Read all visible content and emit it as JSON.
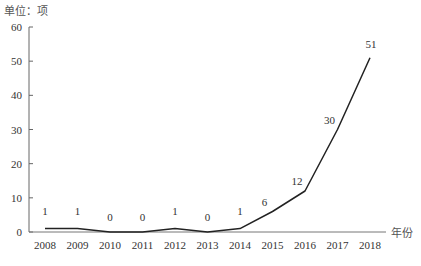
{
  "chart_data": {
    "type": "line",
    "title": "",
    "ylabel": "单位：项",
    "xlabel": "年份",
    "categories": [
      "2008",
      "2009",
      "2010",
      "2011",
      "2012",
      "2013",
      "2014",
      "2015",
      "2016",
      "2017",
      "2018"
    ],
    "series": [
      {
        "name": "",
        "values": [
          1,
          1,
          0,
          0,
          1,
          0,
          1,
          6,
          12,
          30,
          51
        ]
      }
    ],
    "data_labels": [
      "1",
      "1",
      "0",
      "0",
      "1",
      "0",
      "1",
      "6",
      "12",
      "30",
      "51"
    ],
    "ylim": [
      0,
      60
    ],
    "yticks": [
      "0",
      "10",
      "20",
      "30",
      "40",
      "50",
      "60"
    ],
    "grid": false,
    "legend": "none",
    "line_color": "#222222"
  }
}
